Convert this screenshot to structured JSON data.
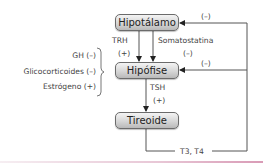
{
  "diagram": {
    "nodes": {
      "hipotalamo": "Hipotálamo",
      "hipofise": "Hipófise",
      "tireoide": "Tireoide"
    },
    "edges": {
      "trh_label": "TRH",
      "trh_effect": "(+)",
      "somatostatina_label": "Somatostatina",
      "somatostatina_effect": "(–)",
      "tsh_label": "TSH",
      "tsh_effect": "(+)",
      "feedback_label": "T3, T4",
      "feedback_hipotalamo_effect": "(–)",
      "feedback_hipofise_effect": "(–)"
    },
    "modulators": [
      {
        "label": "GH (–)"
      },
      {
        "label": "Glicocorticoides (–)"
      },
      {
        "label": "Estrógeno (+)"
      }
    ],
    "colors": {
      "line": "#555555",
      "node_border": "#6b6b6b",
      "accent_rule": "#d99bb6"
    }
  }
}
